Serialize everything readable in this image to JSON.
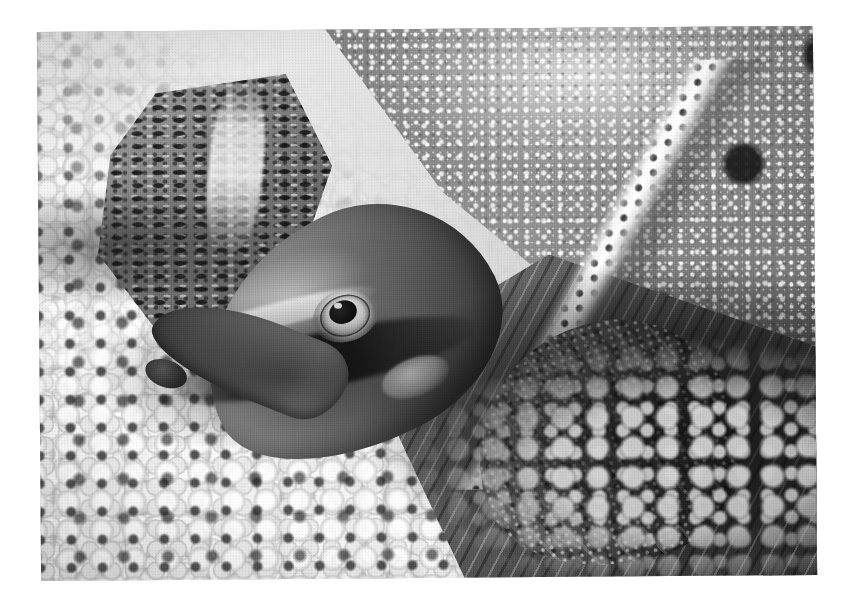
{
  "document": {
    "background_color": "#ffffff",
    "page_width": 853,
    "page_height": 605,
    "content_type": "photograph",
    "color_mode": "black-and-white"
  },
  "photo": {
    "alt_text": "Black-and-white close-up photograph of a softshell turtle resting on pale aquarium gravel",
    "subject": "softshell turtle",
    "orientation": "landscape",
    "left": 39,
    "top": 29,
    "width": 776,
    "height": 549,
    "rotation_deg": -0.45,
    "border": "none",
    "tones": {
      "highlight": "#fbfaf6",
      "light_midtone": "#c8c5bb",
      "midtone": "#8d8a82",
      "dark_midtone": "#524f4a",
      "shadow": "#1c1b18"
    },
    "regions": [
      {
        "name": "carapace",
        "label": "Carapace (leathery shell)",
        "description": "Large diagonal shell mass filling the upper-right, covered in pale tubercles and dark round pigment spots"
      },
      {
        "name": "carapace-rim",
        "label": "Carapace rim",
        "description": "Bright pale band marking the flexible leading edge of the shell, running diagonally from upper-left to lower-right"
      },
      {
        "name": "head",
        "label": "Head",
        "description": "Turtle head in left-of-centre with a long tapering snout pointing down-left"
      },
      {
        "name": "eye",
        "label": "Eye",
        "description": "Round eye with pale ring, dark pupil and small specular glint"
      },
      {
        "name": "neck",
        "label": "Neck",
        "description": "Mottled light and dark neck skin above and behind the head"
      },
      {
        "name": "forelimb",
        "label": "Forelimb",
        "description": "Scaly, folded front limb at centre-right resting on the gravel"
      },
      {
        "name": "gravel",
        "label": "Gravel substrate",
        "description": "Bed of rounded pale pebbles filling the lower-left half of the frame"
      },
      {
        "name": "shadow",
        "label": "Shadow",
        "description": "Deep shadow beneath the turtle's body toward the lower-right"
      }
    ]
  }
}
